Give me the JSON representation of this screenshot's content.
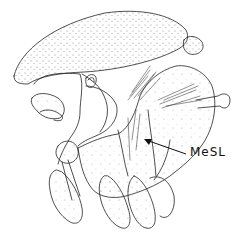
{
  "figure": {
    "type": "anatomical line drawing",
    "labels": [
      {
        "text": "MeSL",
        "points_to": "mesepisternal line region"
      }
    ]
  }
}
